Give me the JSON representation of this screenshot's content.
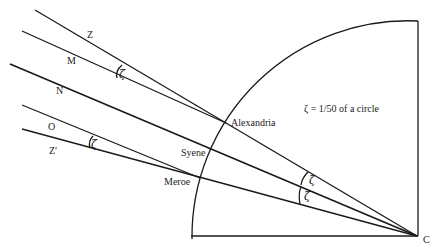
{
  "figure": {
    "note": "ζ = 1/50 of a circle",
    "center_label": "C",
    "places": {
      "alexandria": "Alexandria",
      "syene": "Syene",
      "meroe": "Meroe"
    },
    "ray_labels": {
      "z": "Z",
      "m": "M",
      "n": "N",
      "o": "O",
      "z_prime": "Z′"
    },
    "angle_symbol": "ζ",
    "colors": {
      "ink": "#1a1a1a",
      "background": "#ffffff"
    }
  }
}
